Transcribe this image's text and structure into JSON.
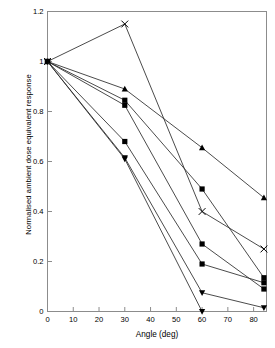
{
  "chart_data": {
    "type": "line",
    "title": "",
    "xlabel": "Angle (deg)",
    "ylabel": "Normalised ambient dose equivalent response",
    "xlim": [
      0,
      85
    ],
    "ylim": [
      0,
      1.2
    ],
    "xticks": [
      0,
      10,
      20,
      30,
      40,
      50,
      60,
      70,
      80
    ],
    "xticklabels": [
      "0",
      "10",
      "20",
      "30",
      "40",
      "50",
      "60",
      "70",
      "80"
    ],
    "yticks": [
      0,
      0.2,
      0.4,
      0.6,
      0.8,
      1,
      1.2
    ],
    "yticklabels": [
      "0",
      "0.2",
      "0.4",
      "0.6",
      "0.8",
      "1",
      "1.2"
    ],
    "grid": false,
    "legend": "none",
    "frame": true,
    "series": [
      {
        "name": "series-1-cross-peak",
        "marker": "cross",
        "x": [
          0,
          30,
          60,
          84
        ],
        "values": [
          1.0,
          1.15,
          0.4,
          0.25
        ]
      },
      {
        "name": "series-2-triangle-up-shallow",
        "marker": "triangle-up",
        "x": [
          0,
          30,
          60,
          84
        ],
        "values": [
          1.0,
          0.89,
          0.655,
          0.455
        ]
      },
      {
        "name": "series-3-square-upper",
        "marker": "square",
        "x": [
          0,
          30,
          60,
          84
        ],
        "values": [
          1.0,
          0.845,
          0.49,
          0.135
        ]
      },
      {
        "name": "series-4-square-mid",
        "marker": "square",
        "x": [
          0,
          30,
          60,
          84
        ],
        "values": [
          1.0,
          0.825,
          0.27,
          0.09
        ]
      },
      {
        "name": "series-5-square-lower",
        "marker": "square",
        "x": [
          0,
          30,
          60,
          84
        ],
        "values": [
          1.0,
          0.68,
          0.19,
          0.115
        ]
      },
      {
        "name": "series-6-triangle-down-shallow-tail",
        "marker": "triangle-down",
        "x": [
          0,
          30,
          60,
          84
        ],
        "values": [
          1.0,
          0.615,
          0.075,
          0.015
        ]
      },
      {
        "name": "series-7-triangle-down-steep",
        "marker": "triangle-down",
        "x": [
          0,
          30,
          60
        ],
        "values": [
          1.0,
          0.61,
          0.0
        ]
      }
    ]
  },
  "axes": {
    "xlabel": "Angle (deg)",
    "ylabel": "Normalised ambient dose equivalent response"
  },
  "style": {
    "line_color": "#2b2b2b",
    "marker_color": "#000000",
    "frame_color": "#8c8c8c",
    "background": "#ffffff"
  }
}
